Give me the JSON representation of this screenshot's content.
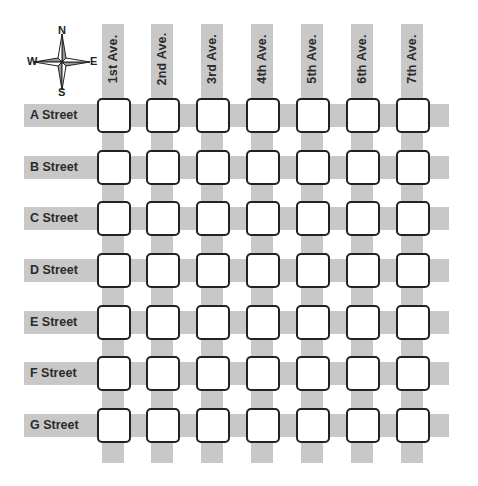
{
  "compass": {
    "north": "N",
    "south": "S",
    "east": "E",
    "west": "W"
  },
  "avenues": [
    {
      "label": "1st Ave."
    },
    {
      "label": "2nd Ave."
    },
    {
      "label": "3rd Ave."
    },
    {
      "label": "4th Ave."
    },
    {
      "label": "5th Ave."
    },
    {
      "label": "6th Ave."
    },
    {
      "label": "7th Ave."
    }
  ],
  "streets": [
    {
      "label": "A Street"
    },
    {
      "label": "B Street"
    },
    {
      "label": "C Street"
    },
    {
      "label": "D Street"
    },
    {
      "label": "E Street"
    },
    {
      "label": "F Street"
    },
    {
      "label": "G Street"
    }
  ],
  "colors": {
    "road": "#c8c8c8",
    "block_border": "#222222",
    "block_fill": "#ffffff",
    "text": "#2b2b2b"
  },
  "grid": {
    "rows": 7,
    "columns": 7
  }
}
